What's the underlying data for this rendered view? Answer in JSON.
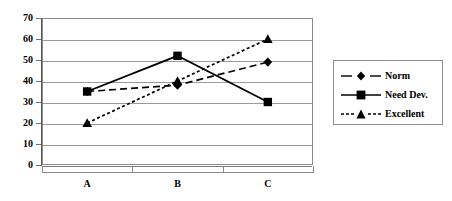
{
  "chart_data": {
    "type": "line",
    "title": "",
    "xlabel": "",
    "ylabel": "",
    "categories": [
      "A",
      "B",
      "C"
    ],
    "ylim": [
      0,
      70
    ],
    "yticks": [
      0,
      10,
      20,
      30,
      40,
      50,
      60,
      70
    ],
    "grid": true,
    "legend_position": "right",
    "series": [
      {
        "name": "Norm",
        "values": [
          35,
          38,
          49
        ],
        "marker": "diamond",
        "line_style": "dashed",
        "color": "#000000"
      },
      {
        "name": "Need Dev.",
        "values": [
          35,
          52,
          30
        ],
        "marker": "square",
        "line_style": "solid",
        "color": "#000000"
      },
      {
        "name": "Excellent",
        "values": [
          20,
          40,
          60
        ],
        "marker": "triangle",
        "line_style": "dotted",
        "color": "#000000"
      }
    ]
  },
  "axes": {
    "ytick_labels": [
      "70",
      "60",
      "50",
      "40",
      "30",
      "20",
      "10",
      "0"
    ],
    "xtick_labels": [
      "A",
      "B",
      "C"
    ]
  },
  "legend": {
    "items": [
      {
        "label": "Norm",
        "marker": "diamond-marker",
        "line": "dashed"
      },
      {
        "label": "Need Dev.",
        "marker": "square-marker",
        "line": "solid"
      },
      {
        "label": "Excellent",
        "marker": "triangle-marker",
        "line": "dotted"
      }
    ]
  },
  "colors": {
    "series": "#000000",
    "grid": "#9b9b9b",
    "frame": "#8a8a8a",
    "background": "#ffffff"
  }
}
